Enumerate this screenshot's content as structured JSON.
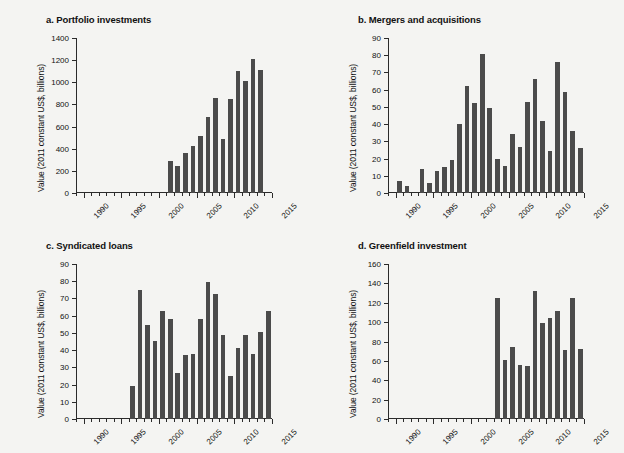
{
  "figure": {
    "background_color": "#f4f4f2",
    "bar_color": "#4b4b4b",
    "axis_color": "#2b2b2b",
    "top_cutoff_note": "",
    "shared_ylabel": "Value (2011 constant US$, billions)"
  },
  "chart_data": [
    {
      "type": "bar",
      "title": "a. Portfolio investments",
      "panel_letter": "a",
      "xlabel": "",
      "ylabel": "Value (2011 constant US$, billions)",
      "ylim": [
        0,
        1400
      ],
      "yticks": [
        0,
        200,
        400,
        600,
        800,
        1000,
        1200,
        1400
      ],
      "xlim": [
        1989,
        2015
      ],
      "xticks": [
        1990,
        1995,
        2000,
        2005,
        2010,
        2015
      ],
      "grid": false,
      "legend": "none",
      "categories": [
        2001,
        2002,
        2003,
        2004,
        2005,
        2006,
        2007,
        2008,
        2009,
        2010,
        2011,
        2012,
        2013
      ],
      "values": [
        290,
        240,
        358,
        424,
        516,
        686,
        858,
        492,
        846,
        1098,
        1008,
        1212,
        1110
      ]
    },
    {
      "type": "bar",
      "title": "b. Mergers and acquisitions",
      "panel_letter": "b",
      "xlabel": "",
      "ylabel": "Value (2011 constant US$, billions)",
      "ylim": [
        0,
        90
      ],
      "yticks": [
        0,
        10,
        20,
        30,
        40,
        50,
        60,
        70,
        80,
        90
      ],
      "xlim": [
        1989,
        2015
      ],
      "xticks": [
        1990,
        1995,
        2000,
        2005,
        2010,
        2015
      ],
      "grid": false,
      "legend": "none",
      "categories": [
        1990,
        1991,
        1993,
        1994,
        1995,
        1996,
        1997,
        1998,
        1999,
        2000,
        2001,
        2002,
        2003,
        2004,
        2005,
        2006,
        2007,
        2008,
        2009,
        2010,
        2011,
        2012,
        2013,
        2014
      ],
      "values": [
        7,
        4,
        14,
        6,
        12.5,
        15,
        19,
        40,
        62,
        52.5,
        81,
        49.5,
        20,
        15.5,
        34.5,
        27,
        53,
        66,
        42,
        24.5,
        76,
        58.5,
        36,
        26,
        51.5
      ]
    },
    {
      "type": "bar",
      "title": "c. Syndicated loans",
      "panel_letter": "c",
      "xlabel": "",
      "ylabel": "Value (2011 constant US$, billions)",
      "ylim": [
        0,
        90
      ],
      "yticks": [
        0,
        10,
        20,
        30,
        40,
        50,
        60,
        70,
        80,
        90
      ],
      "xlim": [
        1989,
        2015
      ],
      "xticks": [
        1990,
        1995,
        2000,
        2005,
        2010,
        2015
      ],
      "grid": false,
      "legend": "none",
      "categories": [
        1996,
        1997,
        1998,
        1999,
        2000,
        2001,
        2002,
        2003,
        2004,
        2005,
        2006,
        2007,
        2008,
        2009,
        2010,
        2011,
        2012,
        2013,
        2014
      ],
      "values": [
        19,
        75,
        54.5,
        45.5,
        62.5,
        58,
        27,
        37,
        38,
        58,
        79.5,
        72.5,
        48.5,
        25,
        41,
        49,
        38,
        50.5,
        63
      ]
    },
    {
      "type": "bar",
      "title": "d. Greenfield investment",
      "panel_letter": "d",
      "xlabel": "",
      "ylabel": "Value (2011 constant US$, billions)",
      "ylim": [
        0,
        160
      ],
      "yticks": [
        0,
        20,
        40,
        60,
        80,
        100,
        120,
        140,
        160
      ],
      "xlim": [
        1989,
        2015
      ],
      "xticks": [
        1990,
        1995,
        2000,
        2005,
        2010,
        2015
      ],
      "grid": false,
      "legend": "none",
      "categories": [
        2003,
        2004,
        2005,
        2006,
        2007,
        2008,
        2009,
        2010,
        2011,
        2012,
        2013,
        2014
      ],
      "values": [
        125,
        61,
        74.5,
        56,
        54.5,
        132.5,
        99,
        104,
        112,
        71,
        125,
        72.5
      ]
    }
  ]
}
